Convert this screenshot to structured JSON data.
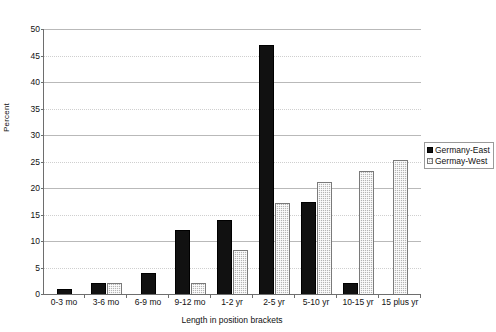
{
  "chart_data": {
    "type": "bar",
    "title": "",
    "xlabel": "Length in position brackets",
    "ylabel": "Percent",
    "ylim": [
      0,
      50
    ],
    "ytick_step": 5,
    "yticks": [
      0,
      5,
      10,
      15,
      20,
      25,
      30,
      35,
      40,
      45,
      50
    ],
    "grid": true,
    "legend_position": "right",
    "categories": [
      "0-3 mo",
      "3-6 mo",
      "6-9 mo",
      "9-12 mo",
      "1-2 yr",
      "2-5 yr",
      "5-10 yr",
      "10-15 yr",
      "15 plus yr"
    ],
    "series": [
      {
        "name": "Germany-East",
        "color": "#111111",
        "values": [
          1,
          2,
          4,
          12,
          14,
          47,
          17.3,
          2,
          0
        ]
      },
      {
        "name": "Germay-West",
        "color": "#b5b5b5",
        "values": [
          0,
          2,
          0,
          2,
          8.3,
          17.2,
          21.2,
          23.3,
          25.3
        ]
      }
    ]
  },
  "legend": {
    "items": [
      {
        "label": "Germany-East",
        "swatch": "east-series-swatch"
      },
      {
        "label": "Germay-West",
        "swatch": "west-series-swatch"
      }
    ]
  },
  "axes": {
    "y_title": "Percent",
    "x_title": "Length in position brackets",
    "ytick_labels": [
      "50",
      "45",
      "40",
      "35",
      "30",
      "25",
      "20",
      "15",
      "10",
      "5",
      "0"
    ]
  }
}
